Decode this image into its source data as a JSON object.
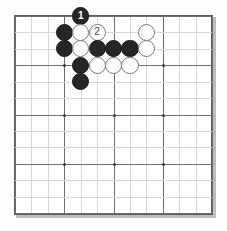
{
  "figure": {
    "kind": "go-board-diagram",
    "board_size": 13,
    "colors": {
      "board_background": "#ffffff",
      "grid_line": "#6e6e6e",
      "border": "#5c5c5c",
      "black_stone": "#262626",
      "white_stone": "#fdfdfd",
      "white_stone_outline": "#7a7a7a",
      "star_point": "#3a3a3a",
      "page_background": "#fdfdfd"
    }
  },
  "board": {
    "size": 13,
    "columns": 13,
    "rows": 13,
    "star_points": [
      {
        "col": 4,
        "row": 4
      },
      {
        "col": 7,
        "row": 4
      },
      {
        "col": 10,
        "row": 4
      },
      {
        "col": 4,
        "row": 7
      },
      {
        "col": 7,
        "row": 7
      },
      {
        "col": 10,
        "row": 7
      },
      {
        "col": 4,
        "row": 10
      },
      {
        "col": 7,
        "row": 10
      },
      {
        "col": 10,
        "row": 10
      }
    ]
  },
  "stones": [
    {
      "col": 5,
      "row": 1,
      "color": "black",
      "label": "1"
    },
    {
      "col": 4,
      "row": 2,
      "color": "black",
      "label": ""
    },
    {
      "col": 5,
      "row": 2,
      "color": "white",
      "label": ""
    },
    {
      "col": 6,
      "row": 2,
      "color": "white",
      "label": "2"
    },
    {
      "col": 9,
      "row": 2,
      "color": "white",
      "label": ""
    },
    {
      "col": 4,
      "row": 3,
      "color": "black",
      "label": ""
    },
    {
      "col": 5,
      "row": 3,
      "color": "white",
      "label": ""
    },
    {
      "col": 6,
      "row": 3,
      "color": "black",
      "label": ""
    },
    {
      "col": 7,
      "row": 3,
      "color": "black",
      "label": ""
    },
    {
      "col": 8,
      "row": 3,
      "color": "black",
      "label": ""
    },
    {
      "col": 9,
      "row": 3,
      "color": "white",
      "label": ""
    },
    {
      "col": 5,
      "row": 4,
      "color": "black",
      "label": ""
    },
    {
      "col": 6,
      "row": 4,
      "color": "white",
      "label": ""
    },
    {
      "col": 7,
      "row": 4,
      "color": "white",
      "label": ""
    },
    {
      "col": 8,
      "row": 4,
      "color": "white",
      "label": ""
    },
    {
      "col": 5,
      "row": 5,
      "color": "black",
      "label": ""
    }
  ],
  "move_labels": [
    {
      "number": "1",
      "color": "black",
      "col": 5,
      "row": 1
    },
    {
      "number": "2",
      "color": "white",
      "col": 6,
      "row": 2
    }
  ]
}
